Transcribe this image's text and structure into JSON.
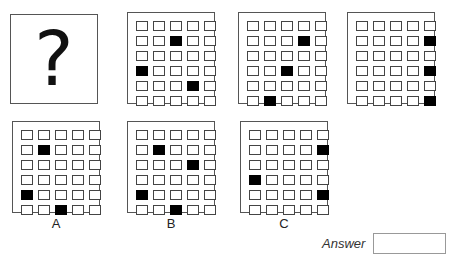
{
  "puzzle": {
    "question_symbol": "?",
    "grid": {
      "rows": 6,
      "cols": 5
    },
    "sequence": [
      {
        "id": "seq-1",
        "filled": [
          [
            1,
            2
          ],
          [
            3,
            0
          ],
          [
            4,
            3
          ]
        ]
      },
      {
        "id": "seq-2",
        "filled": [
          [
            1,
            3
          ],
          [
            3,
            2
          ],
          [
            5,
            1
          ]
        ]
      },
      {
        "id": "seq-3",
        "filled": [
          [
            1,
            4
          ],
          [
            3,
            4
          ],
          [
            5,
            4
          ]
        ]
      }
    ],
    "options": [
      {
        "label": "A",
        "filled": [
          [
            1,
            1
          ],
          [
            4,
            0
          ],
          [
            5,
            2
          ]
        ]
      },
      {
        "label": "B",
        "filled": [
          [
            1,
            1
          ],
          [
            2,
            3
          ],
          [
            4,
            0
          ],
          [
            5,
            2
          ]
        ]
      },
      {
        "label": "C",
        "filled": [
          [
            1,
            4
          ],
          [
            3,
            0
          ],
          [
            4,
            4
          ]
        ]
      }
    ]
  },
  "answer": {
    "label": "Answer",
    "value": ""
  }
}
